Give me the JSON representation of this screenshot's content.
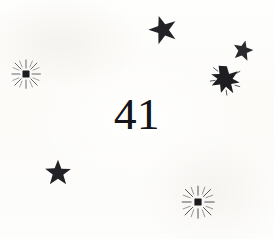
{
  "page": {
    "width": 274,
    "height": 239,
    "background_color": "#fdfdfb",
    "ink_color": "#1a1a1e",
    "kind": "scanned-book-page-ornament"
  },
  "page_number": {
    "label": "41",
    "value": 41
  },
  "decorations": [
    {
      "name": "star-top-center",
      "glyph": "five-point-star",
      "x": 148,
      "y": 14,
      "size": 30,
      "rotation": -18,
      "color": "#232327"
    },
    {
      "name": "sparkle-left",
      "glyph": "burst-sparkle",
      "x": 10,
      "y": 58,
      "size": 32,
      "rotation": 0,
      "color": "#2a2a2e"
    },
    {
      "name": "star-top-right-small",
      "glyph": "five-point-star",
      "x": 232,
      "y": 39,
      "size": 22,
      "rotation": 12,
      "color": "#2a2a2e"
    },
    {
      "name": "starburst-right",
      "glyph": "blob-starburst",
      "x": 208,
      "y": 62,
      "size": 34,
      "rotation": 8,
      "color": "#1e1e22"
    },
    {
      "name": "star-bottom-left",
      "glyph": "five-point-star",
      "x": 44,
      "y": 158,
      "size": 28,
      "rotation": 0,
      "color": "#232327"
    },
    {
      "name": "sparkle-bottom-right",
      "glyph": "burst-sparkle",
      "x": 180,
      "y": 184,
      "size": 36,
      "rotation": 0,
      "color": "#2a2a2e"
    }
  ]
}
